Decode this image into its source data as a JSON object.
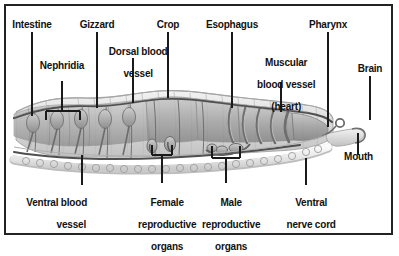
{
  "figure": {
    "border_color": "#232323",
    "background_color": "#ffffff",
    "text_color": "#111111",
    "body_fill": "#d8d8d8",
    "organ_fill": "#b9b9b9",
    "outline_color": "#4a4a4a"
  },
  "labels": {
    "intestine": "Intestine",
    "gizzard": "Gizzard",
    "crop": "Crop",
    "esophagus": "Esophagus",
    "pharynx": "Pharynx",
    "brain": "Brain",
    "dorsal_blood_vessel_l1": "Dorsal blood",
    "dorsal_blood_vessel_l2": "vessel",
    "nephridia": "Nephridia",
    "heart_l1": "Muscular",
    "heart_l2": "blood vessel",
    "heart_l3": "(heart)",
    "mouth": "Mouth",
    "ventral_blood_vessel_l1": "Ventral blood",
    "ventral_blood_vessel_l2": "vessel",
    "female_l1": "Female",
    "female_l2": "reproductive",
    "female_l3": "organs",
    "male_l1": "Male",
    "male_l2": "reproductive",
    "male_l3": "organs",
    "ventral_nerve_cord_l1": "Ventral",
    "ventral_nerve_cord_l2": "nerve cord"
  }
}
